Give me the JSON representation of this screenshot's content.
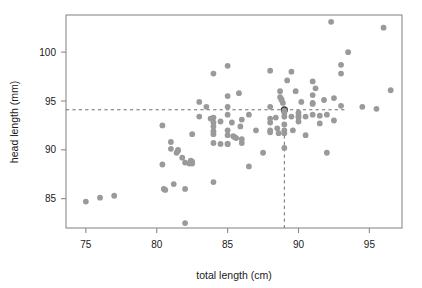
{
  "chart_data": {
    "type": "scatter",
    "title": "",
    "xlabel": "total length (cm)",
    "ylabel": "head length (mm)",
    "xlim": [
      73.6,
      97.3
    ],
    "ylim": [
      82.0,
      103.8
    ],
    "xticks": [
      75,
      80,
      85,
      90,
      95
    ],
    "xticklabels": [
      "75",
      "80",
      "85",
      "90",
      "95"
    ],
    "yticks": [
      85,
      90,
      95,
      100
    ],
    "yticklabels": [
      "85",
      "90",
      "95",
      "100"
    ],
    "grid": false,
    "legend": null,
    "marker_color": "#9a9a9a",
    "highlight_color": "#3d3d3d",
    "frame_color": "#8a8a8a",
    "annotations": {
      "hline": {
        "y": 94.1,
        "style": "dashed",
        "label": ""
      },
      "vline": {
        "x": 89.0,
        "style": "dashed",
        "label": ""
      },
      "highlight_point": {
        "x": 89.0,
        "y": 94.1
      }
    },
    "points": [
      [
        75.0,
        84.7
      ],
      [
        76.0,
        85.1
      ],
      [
        77.0,
        85.3
      ],
      [
        80.4,
        92.5
      ],
      [
        80.4,
        88.5
      ],
      [
        80.5,
        86.0
      ],
      [
        80.6,
        85.9
      ],
      [
        81.0,
        90.8
      ],
      [
        81.0,
        90.1
      ],
      [
        81.2,
        86.5
      ],
      [
        81.4,
        89.7
      ],
      [
        81.5,
        89.9
      ],
      [
        81.5,
        90.0
      ],
      [
        81.8,
        89.2
      ],
      [
        82.0,
        82.5
      ],
      [
        82.0,
        88.7
      ],
      [
        82.0,
        86.0
      ],
      [
        82.3,
        88.6
      ],
      [
        82.4,
        88.9
      ],
      [
        82.5,
        91.6
      ],
      [
        82.5,
        88.6
      ],
      [
        82.5,
        88.8
      ],
      [
        83.0,
        94.9
      ],
      [
        83.0,
        93.4
      ],
      [
        83.5,
        94.4
      ],
      [
        83.8,
        93.2
      ],
      [
        84.0,
        97.8
      ],
      [
        84.0,
        93.3
      ],
      [
        84.0,
        92.8
      ],
      [
        84.0,
        92.4
      ],
      [
        84.0,
        91.9
      ],
      [
        84.0,
        91.6
      ],
      [
        84.0,
        90.7
      ],
      [
        84.0,
        86.7
      ],
      [
        84.5,
        92.9
      ],
      [
        84.5,
        90.6
      ],
      [
        85.0,
        98.6
      ],
      [
        85.0,
        95.5
      ],
      [
        85.0,
        94.4
      ],
      [
        85.0,
        93.6
      ],
      [
        85.0,
        92.0
      ],
      [
        85.0,
        91.5
      ],
      [
        85.0,
        90.6
      ],
      [
        85.0,
        90.6
      ],
      [
        85.3,
        92.8
      ],
      [
        85.4,
        91.4
      ],
      [
        85.5,
        91.3
      ],
      [
        85.6,
        91.2
      ],
      [
        85.8,
        95.8
      ],
      [
        85.9,
        92.4
      ],
      [
        86.0,
        93.1
      ],
      [
        86.0,
        91.1
      ],
      [
        86.0,
        90.7
      ],
      [
        86.5,
        88.3
      ],
      [
        86.5,
        93.6
      ],
      [
        87.0,
        92.0
      ],
      [
        87.5,
        89.7
      ],
      [
        88.0,
        98.1
      ],
      [
        88.0,
        94.4
      ],
      [
        88.0,
        93.2
      ],
      [
        88.0,
        92.8
      ],
      [
        88.0,
        92.0
      ],
      [
        88.0,
        91.8
      ],
      [
        88.4,
        93.3
      ],
      [
        88.5,
        92.2
      ],
      [
        88.6,
        91.7
      ],
      [
        88.7,
        96.0
      ],
      [
        88.7,
        95.4
      ],
      [
        88.8,
        95.2
      ],
      [
        88.8,
        95.1
      ],
      [
        88.9,
        94.8
      ],
      [
        89.0,
        94.1
      ],
      [
        89.0,
        94.0
      ],
      [
        89.0,
        93.8
      ],
      [
        89.0,
        93.4
      ],
      [
        89.0,
        92.6
      ],
      [
        89.0,
        92.0
      ],
      [
        89.0,
        91.7
      ],
      [
        89.0,
        90.2
      ],
      [
        89.2,
        97.1
      ],
      [
        89.5,
        98.0
      ],
      [
        89.5,
        93.4
      ],
      [
        89.6,
        92.0
      ],
      [
        89.8,
        96.0
      ],
      [
        90.0,
        93.8
      ],
      [
        90.0,
        93.5
      ],
      [
        90.0,
        93.3
      ],
      [
        90.0,
        92.9
      ],
      [
        90.2,
        94.9
      ],
      [
        90.5,
        93.4
      ],
      [
        90.5,
        91.5
      ],
      [
        91.0,
        97.0
      ],
      [
        91.0,
        95.6
      ],
      [
        91.0,
        94.8
      ],
      [
        91.0,
        94.7
      ],
      [
        91.0,
        93.6
      ],
      [
        91.2,
        96.3
      ],
      [
        91.5,
        93.5
      ],
      [
        91.5,
        92.7
      ],
      [
        91.8,
        95.1
      ],
      [
        92.0,
        93.6
      ],
      [
        92.0,
        89.7
      ],
      [
        92.3,
        103.1
      ],
      [
        92.5,
        95.3
      ],
      [
        92.5,
        93.0
      ],
      [
        93.0,
        98.7
      ],
      [
        93.0,
        97.8
      ],
      [
        93.0,
        94.5
      ],
      [
        93.5,
        100.0
      ],
      [
        94.5,
        94.4
      ],
      [
        95.5,
        94.2
      ],
      [
        96.0,
        102.5
      ],
      [
        96.5,
        96.1
      ]
    ]
  }
}
